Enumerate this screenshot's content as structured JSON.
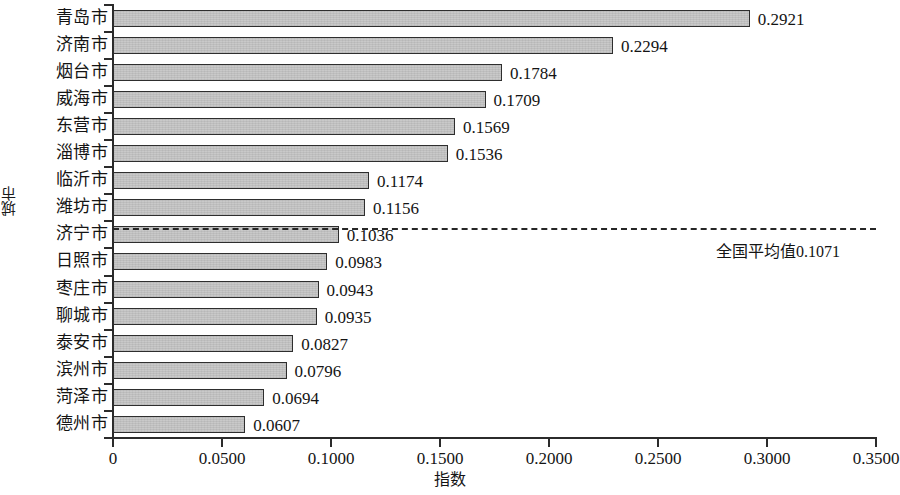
{
  "chart_data": {
    "type": "bar",
    "orientation": "horizontal",
    "title": "",
    "xlabel": "指数",
    "ylabel": "城市",
    "xlim": [
      0,
      0.35
    ],
    "grid": false,
    "legend": null,
    "xticks": [
      "0",
      "0.0500",
      "0.1000",
      "0.1500",
      "0.2000",
      "0.2500",
      "0.3000",
      "0.3500"
    ],
    "xtick_values": [
      0,
      0.05,
      0.1,
      0.15,
      0.2,
      0.25,
      0.3,
      0.35
    ],
    "categories": [
      "青岛市",
      "济南市",
      "烟台市",
      "威海市",
      "东营市",
      "淄博市",
      "临沂市",
      "潍坊市",
      "济宁市",
      "日照市",
      "枣庄市",
      "聊城市",
      "泰安市",
      "滨州市",
      "菏泽市",
      "德州市"
    ],
    "values": [
      0.2921,
      0.2294,
      0.1784,
      0.1709,
      0.1569,
      0.1536,
      0.1174,
      0.1156,
      0.1036,
      0.0983,
      0.0943,
      0.0935,
      0.0827,
      0.0796,
      0.0694,
      0.0607
    ],
    "value_labels": [
      "0.2921",
      "0.2294",
      "0.1784",
      "0.1709",
      "0.1569",
      "0.1536",
      "0.1174",
      "0.1156",
      "0.1036",
      "0.0983",
      "0.0943",
      "0.0935",
      "0.0827",
      "0.0796",
      "0.0694",
      "0.0607"
    ],
    "reference_line": {
      "value": 0.1071,
      "label": "全国平均值0.1071",
      "style": "dashed"
    },
    "colors": {
      "bar_fill": "#c9c9c9",
      "bar_border": "#2e2e2e",
      "axis": "#2b2b2b",
      "text": "#141414",
      "reference_line": "#262626",
      "background": "#ffffff"
    }
  }
}
